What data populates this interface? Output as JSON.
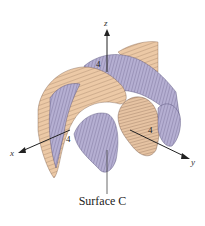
{
  "figure": {
    "caption": "Surface C",
    "axes": {
      "x_label": "x",
      "y_label": "y",
      "z_label": "z",
      "x_tick": "4",
      "y_tick": "4",
      "z_tick": "4"
    },
    "colors": {
      "surface_top": "#e9c9a8",
      "surface_bottom": "#b4aed0",
      "mesh_line": "#5a4a40",
      "axis": "#222222"
    }
  }
}
